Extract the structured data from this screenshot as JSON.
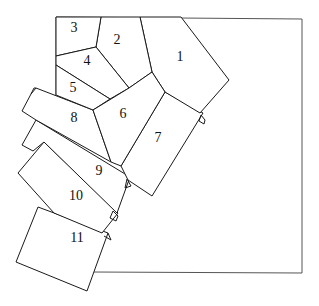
{
  "diagram": {
    "colors": {
      "line": "#1a1a1a",
      "frame": "#555555",
      "background": "#ffffff"
    },
    "frame": {
      "top_left": [
        56,
        17
      ],
      "top_right": [
        302,
        19
      ],
      "bottom_right": [
        302,
        273
      ],
      "bottom_left": [
        54,
        272
      ]
    },
    "regions": [
      {
        "id": 1,
        "label": "1"
      },
      {
        "id": 2,
        "label": "2"
      },
      {
        "id": 3,
        "label": "3"
      },
      {
        "id": 4,
        "label": "4"
      },
      {
        "id": 5,
        "label": "5"
      },
      {
        "id": 6,
        "label": "6"
      },
      {
        "id": 7,
        "label": "7"
      },
      {
        "id": 8,
        "label": "8"
      },
      {
        "id": 9,
        "label": "9"
      },
      {
        "id": 10,
        "label": "10"
      },
      {
        "id": 11,
        "label": "11"
      }
    ]
  }
}
